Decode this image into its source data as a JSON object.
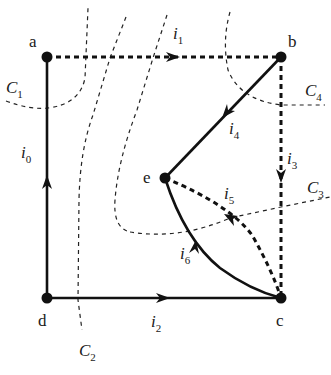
{
  "diagram": {
    "type": "graph-cutsets",
    "nodes": [
      {
        "id": "a",
        "label": "a",
        "x": 47,
        "y": 57
      },
      {
        "id": "b",
        "label": "b",
        "x": 281,
        "y": 57
      },
      {
        "id": "c",
        "label": "c",
        "x": 281,
        "y": 298
      },
      {
        "id": "d",
        "label": "d",
        "x": 47,
        "y": 298
      },
      {
        "id": "e",
        "label": "e",
        "x": 165,
        "y": 178
      }
    ],
    "edges": [
      {
        "id": "i0",
        "label": "i",
        "sub": "0",
        "from": "d",
        "to": "a",
        "style": "solid"
      },
      {
        "id": "i1",
        "label": "i",
        "sub": "1",
        "from": "a",
        "to": "b",
        "style": "dashed"
      },
      {
        "id": "i2",
        "label": "i",
        "sub": "2",
        "from": "d",
        "to": "c",
        "style": "solid"
      },
      {
        "id": "i3",
        "label": "i",
        "sub": "3",
        "from": "b",
        "to": "c",
        "style": "dashed"
      },
      {
        "id": "i4",
        "label": "i",
        "sub": "4",
        "from": "b",
        "to": "e",
        "style": "solid"
      },
      {
        "id": "i5",
        "label": "i",
        "sub": "5",
        "from": "c",
        "to": "e",
        "style": "dashed"
      },
      {
        "id": "i6",
        "label": "i",
        "sub": "6",
        "from": "c",
        "to": "e",
        "style": "solid"
      }
    ],
    "cutsets": [
      {
        "id": "C1",
        "label": "C",
        "sub": "1"
      },
      {
        "id": "C2",
        "label": "C",
        "sub": "2"
      },
      {
        "id": "C3",
        "label": "C",
        "sub": "3"
      },
      {
        "id": "C4",
        "label": "C",
        "sub": "4"
      }
    ]
  }
}
